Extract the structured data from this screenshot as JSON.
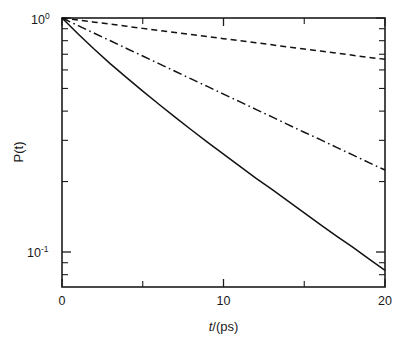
{
  "chart_data": {
    "type": "line",
    "title": "",
    "subtitle": "",
    "xlabel": "t/(ps)",
    "xlabel_parts": {
      "variable": "t",
      "rest": "/(ps)"
    },
    "ylabel": "P(t)",
    "xscale": "linear",
    "yscale": "log",
    "xlim": [
      0,
      20
    ],
    "ylim": [
      0.07,
      1.0
    ],
    "grid": false,
    "legend": "none",
    "x_ticks_major": [
      0,
      10,
      20
    ],
    "x_ticklabels": [
      "0",
      "10",
      "20"
    ],
    "x_ticks_minor": [
      5,
      15
    ],
    "y_ticks_major": [
      1.0,
      0.1
    ],
    "y_ticklabels": [
      "10^0",
      "10^-1"
    ],
    "y_ticklabel_mantissa": "10",
    "y_ticklabel_exp_top": "0",
    "y_ticklabel_exp_bottom": "-1",
    "y_ticks_minor": [
      0.9,
      0.8,
      0.7,
      0.6,
      0.5,
      0.4,
      0.3,
      0.2,
      0.09,
      0.08,
      0.07
    ],
    "axis_color": "#1c1c1c",
    "curve_color": "#121212",
    "background": "#ffffff",
    "series": [
      {
        "name": "solid-curve",
        "style": "solid",
        "x": [
          0,
          1,
          2,
          3,
          4,
          5,
          6,
          7,
          8,
          9,
          10,
          11,
          12,
          13,
          14,
          15,
          16,
          17,
          18,
          19,
          20
        ],
        "y": [
          1.0,
          0.855,
          0.735,
          0.637,
          0.556,
          0.487,
          0.428,
          0.377,
          0.333,
          0.295,
          0.262,
          0.233,
          0.207,
          0.185,
          0.165,
          0.147,
          0.131,
          0.117,
          0.105,
          0.0935,
          0.0835
        ]
      },
      {
        "name": "dash-dot-curve",
        "style": "dashdot",
        "x": [
          0,
          1,
          2,
          3,
          4,
          5,
          6,
          7,
          8,
          9,
          10,
          11,
          12,
          13,
          14,
          15,
          16,
          17,
          18,
          19,
          20
        ],
        "y": [
          1.0,
          0.928,
          0.861,
          0.799,
          0.741,
          0.688,
          0.638,
          0.592,
          0.549,
          0.51,
          0.473,
          0.439,
          0.407,
          0.378,
          0.35,
          0.325,
          0.302,
          0.28,
          0.26,
          0.241,
          0.224
        ]
      },
      {
        "name": "dashed-curve",
        "style": "dashed",
        "x": [
          0,
          1,
          2,
          3,
          4,
          5,
          6,
          7,
          8,
          9,
          10,
          11,
          12,
          13,
          14,
          15,
          16,
          17,
          18,
          19,
          20
        ],
        "y": [
          1.0,
          0.98,
          0.96,
          0.941,
          0.922,
          0.903,
          0.885,
          0.867,
          0.85,
          0.833,
          0.816,
          0.8,
          0.784,
          0.768,
          0.752,
          0.737,
          0.722,
          0.708,
          0.693,
          0.679,
          0.666
        ]
      }
    ]
  }
}
